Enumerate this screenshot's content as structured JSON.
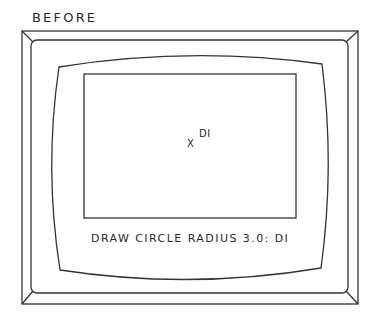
{
  "figure": {
    "title": "BEFORE"
  },
  "monitor": {
    "screen": {
      "viewport": {
        "cursor_symbol": "X",
        "point_label": "DI"
      },
      "command_line": {
        "prompt_text": "DRAW CIRCLE RADIUS 3.0: DI"
      }
    }
  },
  "colors": {
    "line": "#333333",
    "background": "#ffffff",
    "text": "#2a2a2a"
  }
}
